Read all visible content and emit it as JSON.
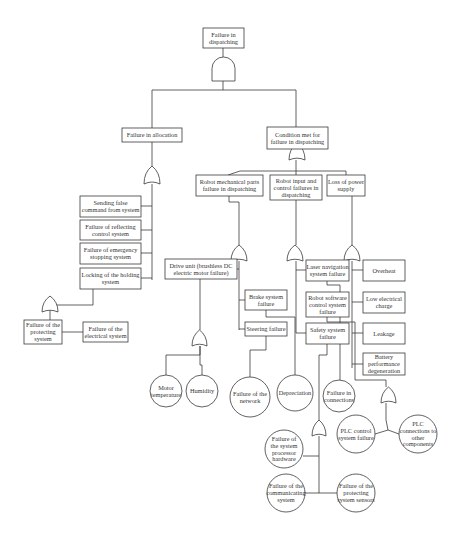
{
  "title": "Failure in dispatching",
  "colors": {
    "line": "#3a3a3a",
    "text": "#333333",
    "background": "#ffffff"
  },
  "nodes": [
    {
      "id": "top",
      "shape": "box",
      "x": 203,
      "y": 28,
      "w": 41,
      "h": 20,
      "lines": [
        "Failure in",
        "dispatching"
      ]
    },
    {
      "id": "alloc",
      "shape": "box",
      "x": 122,
      "y": 128,
      "w": 60,
      "h": 14,
      "lines": [
        "Failure in allocation"
      ]
    },
    {
      "id": "cond",
      "shape": "box",
      "x": 267,
      "y": 127,
      "w": 61,
      "h": 22,
      "lines": [
        "Condition met for",
        "failure in dispatching"
      ]
    },
    {
      "id": "send",
      "shape": "box",
      "x": 80,
      "y": 196,
      "w": 61,
      "h": 21,
      "lines": [
        "Sending false",
        "command from system"
      ]
    },
    {
      "id": "reflect",
      "shape": "box",
      "x": 80,
      "y": 220,
      "w": 61,
      "h": 20,
      "lines": [
        "Failure of reflecting",
        "control system"
      ]
    },
    {
      "id": "emerg",
      "shape": "box",
      "x": 80,
      "y": 243,
      "w": 61,
      "h": 21,
      "lines": [
        "Failure of emergency",
        "stopping system"
      ]
    },
    {
      "id": "lock",
      "shape": "box",
      "x": 80,
      "y": 268,
      "w": 61,
      "h": 21,
      "lines": [
        "Locking of the holding",
        "system"
      ]
    },
    {
      "id": "protect",
      "shape": "box",
      "x": 24,
      "y": 320,
      "w": 38,
      "h": 24,
      "lines": [
        "Failure of the",
        "protecting",
        "system"
      ]
    },
    {
      "id": "electrical",
      "shape": "box",
      "x": 83,
      "y": 322,
      "w": 45,
      "h": 20,
      "lines": [
        "Failure of the",
        "electrical system"
      ]
    },
    {
      "id": "mech",
      "shape": "box",
      "x": 196,
      "y": 175,
      "w": 67,
      "h": 21,
      "lines": [
        "Robot mechanical parts",
        "failure in dispatching"
      ]
    },
    {
      "id": "input",
      "shape": "box",
      "x": 270,
      "y": 175,
      "w": 52,
      "h": 25,
      "lines": [
        "Robot input and",
        "control failures in",
        "dispatching"
      ]
    },
    {
      "id": "power",
      "shape": "box",
      "x": 327,
      "y": 175,
      "w": 38,
      "h": 21,
      "lines": [
        "Loss of power",
        "supply"
      ]
    },
    {
      "id": "drive",
      "shape": "box",
      "x": 165,
      "y": 259,
      "w": 72,
      "h": 20,
      "lines": [
        "Drive unit (brushless DC",
        "electric motor failure)"
      ]
    },
    {
      "id": "brake",
      "shape": "box",
      "x": 245,
      "y": 290,
      "w": 42,
      "h": 20,
      "lines": [
        "Brake system",
        "failure"
      ]
    },
    {
      "id": "steer",
      "shape": "box",
      "x": 245,
      "y": 322,
      "w": 42,
      "h": 14,
      "lines": [
        "Steering failure"
      ]
    },
    {
      "id": "laser",
      "shape": "box",
      "x": 306,
      "y": 260,
      "w": 43,
      "h": 21,
      "lines": [
        "Laser navigation",
        "system failure"
      ]
    },
    {
      "id": "software",
      "shape": "box",
      "x": 306,
      "y": 292,
      "w": 43,
      "h": 25,
      "lines": [
        "Robot software",
        "control system",
        "failure"
      ]
    },
    {
      "id": "safety",
      "shape": "box",
      "x": 306,
      "y": 323,
      "w": 43,
      "h": 21,
      "lines": [
        "Safety system",
        "failure"
      ]
    },
    {
      "id": "overheat",
      "shape": "box",
      "x": 363,
      "y": 260,
      "w": 42,
      "h": 21,
      "lines": [
        "Overheat"
      ]
    },
    {
      "id": "lowcharge",
      "shape": "box",
      "x": 363,
      "y": 292,
      "w": 42,
      "h": 21,
      "lines": [
        "Low electrical",
        "charge"
      ]
    },
    {
      "id": "leakage",
      "shape": "box",
      "x": 363,
      "y": 323,
      "w": 42,
      "h": 21,
      "lines": [
        "Leakage"
      ]
    },
    {
      "id": "battery",
      "shape": "box",
      "x": 363,
      "y": 353,
      "w": 42,
      "h": 22,
      "lines": [
        "Battery",
        "performance",
        "degeneration"
      ]
    },
    {
      "id": "motortemp",
      "shape": "circle",
      "cx": 166,
      "cy": 391,
      "r": 16,
      "lines": [
        "Motor",
        "temperature"
      ]
    },
    {
      "id": "humidity",
      "shape": "circle",
      "cx": 202,
      "cy": 391,
      "r": 16,
      "lines": [
        "Humidity"
      ]
    },
    {
      "id": "network",
      "shape": "circle",
      "cx": 250,
      "cy": 397,
      "r": 20,
      "lines": [
        "Failure of the",
        "network"
      ]
    },
    {
      "id": "depreciation",
      "shape": "circle",
      "cx": 295,
      "cy": 393,
      "r": 18,
      "lines": [
        "Depreciation"
      ]
    },
    {
      "id": "connections",
      "shape": "circle",
      "cx": 339,
      "cy": 396,
      "r": 16,
      "lines": [
        "Failure in",
        "connections"
      ]
    },
    {
      "id": "plccontrol",
      "shape": "circle",
      "cx": 356,
      "cy": 434,
      "r": 19,
      "lines": [
        "PLC control",
        "system failure"
      ]
    },
    {
      "id": "plcconn",
      "shape": "circle",
      "cx": 418,
      "cy": 434,
      "r": 19,
      "lines": [
        "PLC",
        "connections to",
        "other",
        "components"
      ]
    },
    {
      "id": "processor",
      "shape": "circle",
      "cx": 284,
      "cy": 449,
      "r": 19,
      "lines": [
        "Failure of",
        "the system",
        "processor",
        "hardware"
      ]
    },
    {
      "id": "communicating",
      "shape": "circle",
      "cx": 286,
      "cy": 493,
      "r": 19,
      "lines": [
        "Failure of the",
        "communicating",
        "system"
      ]
    },
    {
      "id": "protectsensors",
      "shape": "circle",
      "cx": 356,
      "cy": 493,
      "r": 19,
      "lines": [
        "Failure of the",
        "protecting",
        "system sensors"
      ]
    }
  ],
  "gates": [
    {
      "id": "g_top",
      "type": "and",
      "x": 212,
      "y": 57,
      "w": 23,
      "h": 24
    },
    {
      "id": "g_alloc",
      "type": "or",
      "x": 144,
      "y": 166,
      "w": 16,
      "h": 18
    },
    {
      "id": "g_cond",
      "type": "or",
      "x": 289,
      "y": 133,
      "w": 16,
      "h": 17,
      "yOffset": 10
    },
    {
      "id": "g_mech",
      "type": "or",
      "x": 231,
      "y": 245,
      "w": 16,
      "h": 16
    },
    {
      "id": "g_input",
      "type": "or",
      "x": 287,
      "y": 245,
      "w": 16,
      "h": 16
    },
    {
      "id": "g_power",
      "type": "or",
      "x": 344,
      "y": 245,
      "w": 16,
      "h": 16
    },
    {
      "id": "g_lock",
      "type": "or",
      "x": 42,
      "y": 296,
      "w": 16,
      "h": 16
    },
    {
      "id": "g_drive",
      "type": "or",
      "x": 192,
      "y": 330,
      "w": 15,
      "h": 16
    },
    {
      "id": "g_battery",
      "type": "or",
      "x": 381,
      "y": 387,
      "w": 15,
      "h": 16
    },
    {
      "id": "g_safety",
      "type": "or",
      "x": 312,
      "y": 420,
      "w": 14,
      "h": 16
    }
  ],
  "edges": [
    [
      [
        223,
        48
      ],
      [
        223,
        57
      ]
    ],
    [
      [
        223,
        81
      ],
      [
        223,
        90
      ]
    ],
    [
      [
        152,
        90
      ],
      [
        296,
        90
      ]
    ],
    [
      [
        152,
        90
      ],
      [
        152,
        128
      ]
    ],
    [
      [
        296,
        90
      ],
      [
        296,
        127
      ]
    ],
    [
      [
        152,
        142
      ],
      [
        152,
        166
      ]
    ],
    [
      [
        152,
        184
      ],
      [
        152,
        280
      ]
    ],
    [
      [
        141,
        206
      ],
      [
        152,
        206
      ]
    ],
    [
      [
        141,
        230
      ],
      [
        152,
        230
      ]
    ],
    [
      [
        141,
        253
      ],
      [
        152,
        253
      ]
    ],
    [
      [
        141,
        278
      ],
      [
        152,
        278
      ]
    ],
    [
      [
        296,
        149
      ],
      [
        296,
        143
      ]
    ],
    [
      [
        296,
        160
      ],
      [
        296,
        166
      ]
    ],
    [
      [
        240,
        171
      ],
      [
        346,
        171
      ]
    ],
    [
      [
        240,
        171
      ],
      [
        228,
        175
      ]
    ],
    [
      [
        296,
        166
      ],
      [
        296,
        175
      ]
    ],
    [
      [
        346,
        171
      ],
      [
        346,
        175
      ]
    ],
    [
      [
        229,
        196
      ],
      [
        229,
        202
      ],
      [
        239,
        202
      ],
      [
        239,
        245
      ]
    ],
    [
      [
        239,
        261
      ],
      [
        239,
        330
      ]
    ],
    [
      [
        237,
        269
      ],
      [
        239,
        269
      ]
    ],
    [
      [
        239,
        300
      ],
      [
        245,
        300
      ]
    ],
    [
      [
        239,
        329
      ],
      [
        245,
        329
      ]
    ],
    [
      [
        296,
        200
      ],
      [
        296,
        245
      ]
    ],
    [
      [
        296,
        261
      ],
      [
        296,
        333
      ]
    ],
    [
      [
        296,
        270
      ],
      [
        306,
        270
      ]
    ],
    [
      [
        296,
        333
      ],
      [
        306,
        333
      ]
    ],
    [
      [
        352,
        196
      ],
      [
        352,
        245
      ]
    ],
    [
      [
        352,
        261
      ],
      [
        352,
        368
      ]
    ],
    [
      [
        352,
        270
      ],
      [
        363,
        270
      ]
    ],
    [
      [
        352,
        302
      ],
      [
        363,
        302
      ]
    ],
    [
      [
        352,
        333
      ],
      [
        363,
        333
      ]
    ],
    [
      [
        352,
        364
      ],
      [
        363,
        364
      ]
    ],
    [
      [
        93,
        289
      ],
      [
        93,
        305
      ],
      [
        50,
        305
      ],
      [
        50,
        312
      ]
    ],
    [
      [
        50,
        296
      ],
      [
        50,
        305
      ]
    ],
    [
      [
        50,
        312
      ],
      [
        50,
        344
      ]
    ],
    [
      [
        50,
        332
      ],
      [
        62,
        332
      ]
    ],
    [
      [
        50,
        332
      ],
      [
        83,
        332
      ]
    ],
    [
      [
        200,
        279
      ],
      [
        200,
        330
      ]
    ],
    [
      [
        200,
        346
      ],
      [
        200,
        355
      ],
      [
        166,
        355
      ],
      [
        166,
        375
      ]
    ],
    [
      [
        200,
        346
      ],
      [
        200,
        365
      ],
      [
        202,
        365
      ],
      [
        202,
        375
      ]
    ],
    [
      [
        266,
        336
      ],
      [
        266,
        350
      ],
      [
        250,
        350
      ],
      [
        250,
        377
      ]
    ],
    [
      [
        266,
        310
      ],
      [
        266,
        317
      ],
      [
        295,
        317
      ],
      [
        295,
        375
      ]
    ],
    [
      [
        327,
        281
      ],
      [
        327,
        285
      ],
      [
        340,
        285
      ],
      [
        340,
        380
      ]
    ],
    [
      [
        327,
        317
      ],
      [
        327,
        322
      ],
      [
        355,
        322
      ],
      [
        355,
        380
      ],
      [
        386,
        380
      ],
      [
        386,
        387
      ]
    ],
    [
      [
        386,
        403
      ],
      [
        386,
        420
      ],
      [
        388,
        430
      ],
      [
        375,
        434
      ]
    ],
    [
      [
        388,
        430
      ],
      [
        399,
        434
      ]
    ],
    [
      [
        327,
        344
      ],
      [
        327,
        355
      ],
      [
        319,
        355
      ],
      [
        319,
        420
      ]
    ],
    [
      [
        319,
        436
      ],
      [
        319,
        493
      ]
    ],
    [
      [
        303,
        456
      ],
      [
        319,
        456
      ]
    ],
    [
      [
        305,
        493
      ],
      [
        337,
        493
      ]
    ]
  ]
}
